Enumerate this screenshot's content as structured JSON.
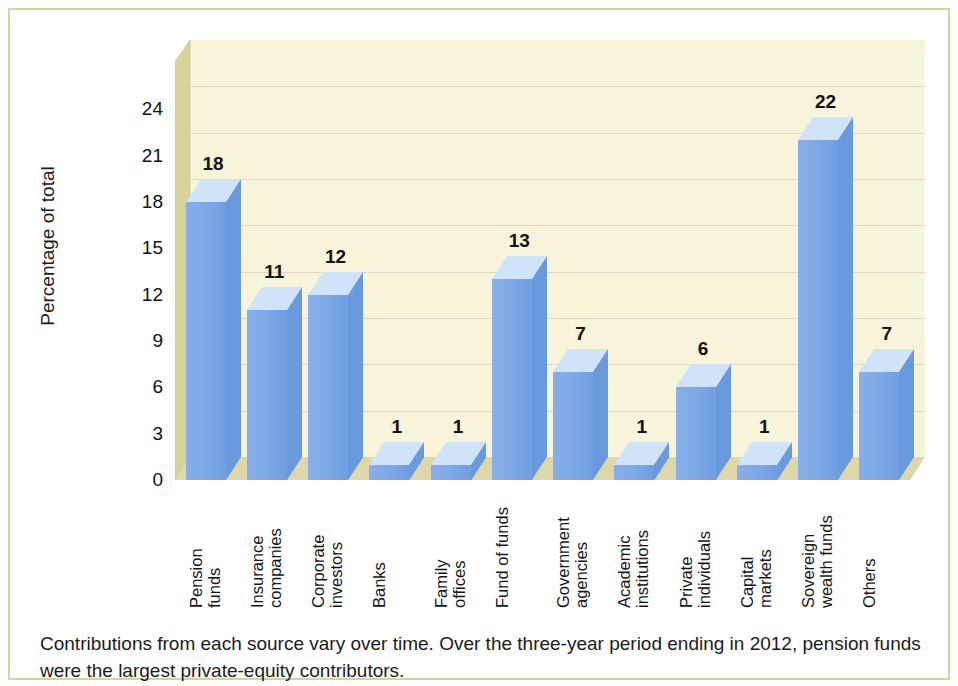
{
  "figure": {
    "caption": "Contributions from each source vary over time. Over the three-year period ending in 2012, pension funds were the largest private-equity contributors."
  },
  "colors": {
    "bar_front": "#7ea9e6",
    "bar_side": "#6a9ade",
    "bar_top": "#cfe4f8",
    "panel_back": "#f7f4d9",
    "panel_wall": "#d7d29a",
    "panel_floor": "#ded8a8",
    "gridline": "#ddd9c4",
    "frame_border": "#cfd3a6",
    "text": "#111111"
  },
  "chart_data": {
    "type": "bar",
    "title": "",
    "xlabel": "",
    "ylabel": "Percentage of total",
    "ylim": [
      0,
      27
    ],
    "yticks": [
      0,
      3,
      6,
      9,
      12,
      15,
      18,
      21,
      24
    ],
    "grid": true,
    "legend": "none",
    "categories": [
      "Pension funds",
      "Insurance companies",
      "Corporate investors",
      "Banks",
      "Family offices",
      "Fund of funds",
      "Government agencies",
      "Academic institutions",
      "Private individuals",
      "Capital markets",
      "Sovereign wealth funds",
      "Others"
    ],
    "category_lines": [
      [
        "Pension",
        "funds"
      ],
      [
        "Insurance",
        "companies"
      ],
      [
        "Corporate",
        "investors"
      ],
      [
        "Banks",
        ""
      ],
      [
        "Family",
        "offices"
      ],
      [
        "Fund of funds",
        ""
      ],
      [
        "Government",
        "agencies"
      ],
      [
        "Academic",
        "institutions"
      ],
      [
        "Private",
        "individuals"
      ],
      [
        "Capital",
        "markets"
      ],
      [
        "Sovereign",
        "wealth funds"
      ],
      [
        "Others",
        ""
      ]
    ],
    "values": [
      18,
      11,
      12,
      1,
      1,
      13,
      7,
      1,
      6,
      1,
      22,
      7
    ],
    "value_labels": [
      "18",
      "11",
      "12",
      "1",
      "1",
      "13",
      "7",
      "1",
      "6",
      "1",
      "22",
      "7"
    ]
  }
}
